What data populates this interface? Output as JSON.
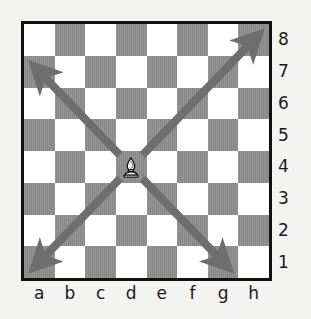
{
  "diagram": {
    "kind": "chess-board-diagram",
    "piece_name": "white-bishop",
    "piece_square": "d4",
    "background_color": "#f3f3f1",
    "border_color": "#111111",
    "light_square_color": "#ffffff",
    "dark_square_color": "#8c8c8c",
    "arrow_color": "#6e6e6e"
  },
  "labels": {
    "files": [
      "a",
      "b",
      "c",
      "d",
      "e",
      "f",
      "g",
      "h"
    ],
    "ranks": [
      "8",
      "7",
      "6",
      "5",
      "4",
      "3",
      "2",
      "1"
    ]
  },
  "board": {
    "files": 8,
    "ranks": 8,
    "top_left_square_color": "light",
    "squares": [
      [
        "light",
        "dark",
        "light",
        "dark",
        "light",
        "dark",
        "light",
        "dark"
      ],
      [
        "dark",
        "light",
        "dark",
        "light",
        "dark",
        "light",
        "dark",
        "light"
      ],
      [
        "light",
        "dark",
        "light",
        "dark",
        "light",
        "dark",
        "light",
        "dark"
      ],
      [
        "dark",
        "light",
        "dark",
        "light",
        "dark",
        "light",
        "dark",
        "light"
      ],
      [
        "light",
        "dark",
        "light",
        "dark",
        "light",
        "dark",
        "light",
        "dark"
      ],
      [
        "dark",
        "light",
        "dark",
        "light",
        "dark",
        "light",
        "dark",
        "light"
      ],
      [
        "light",
        "dark",
        "light",
        "dark",
        "light",
        "dark",
        "light",
        "dark"
      ],
      [
        "dark",
        "light",
        "dark",
        "light",
        "dark",
        "light",
        "dark",
        "light"
      ]
    ]
  },
  "pieces": [
    {
      "name": "white-bishop",
      "square": "d4",
      "file_index": 3,
      "rank_index": 4,
      "color": "white"
    }
  ],
  "arrows": [
    {
      "name": "arrow-up-left",
      "from_square": "d4",
      "to_square": "a7",
      "direction": "up-left"
    },
    {
      "name": "arrow-up-right",
      "from_square": "d4",
      "to_square": "h8",
      "direction": "up-right"
    },
    {
      "name": "arrow-down-left",
      "from_square": "d4",
      "to_square": "a1",
      "direction": "down-left"
    },
    {
      "name": "arrow-down-right",
      "from_square": "d4",
      "to_square": "g1",
      "direction": "down-right"
    }
  ]
}
